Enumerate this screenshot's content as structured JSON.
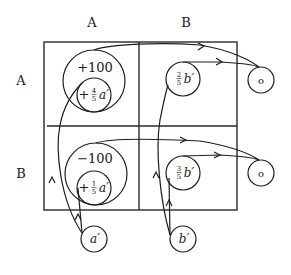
{
  "diagram": {
    "column_headers": [
      "A",
      "B"
    ],
    "row_headers": [
      "A",
      "B"
    ],
    "cells": {
      "AA": {
        "outer_value": "+100",
        "inner_sign": "+",
        "inner_frac_num": "4",
        "inner_frac_den": "5",
        "inner_var": "a′"
      },
      "BA": {
        "outer_value": "−100",
        "inner_sign": "+",
        "inner_frac_num": "1",
        "inner_frac_den": "5",
        "inner_var": "a′"
      },
      "AB": {
        "frac_num": "2",
        "frac_den": "5",
        "var": "b′"
      },
      "BB": {
        "frac_num": "3",
        "frac_den": "5",
        "var": "b′"
      }
    },
    "sources": [
      {
        "id": "a",
        "label": "a′"
      },
      {
        "id": "b",
        "label": "b′"
      }
    ],
    "sinks": [
      {
        "id": "o1",
        "label": "o"
      },
      {
        "id": "o2",
        "label": "o"
      }
    ],
    "colors": {
      "ink": "#1e1e1e",
      "background": "#ffffff"
    }
  }
}
